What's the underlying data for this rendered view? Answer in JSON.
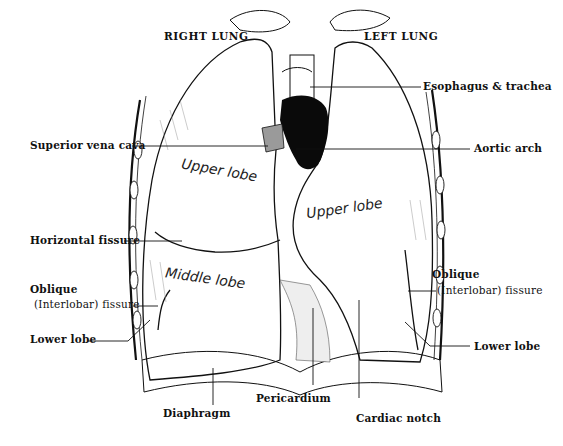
{
  "diagram": {
    "titles": {
      "right_lung": "RIGHT LUNG",
      "left_lung": "LEFT LUNG"
    },
    "lobe_labels": {
      "right_upper": "Upper lobe",
      "right_middle": "Middle lobe",
      "left_upper": "Upper lobe"
    },
    "labels_left": {
      "superior_vena_cava": "Superior vena cava",
      "horizontal_fissure": "Horizontal fissure",
      "oblique_line1": "Oblique",
      "oblique_line2": "(Interlobar) fissure",
      "lower_lobe": "Lower lobe"
    },
    "labels_right": {
      "esophagus_trachea": "Esophagus & trachea",
      "aortic_arch": "Aortic arch",
      "oblique_line1": "Oblique",
      "oblique_line2": "(Interlobar) fissure",
      "lower_lobe": "Lower lobe"
    },
    "labels_bottom": {
      "diaphragm": "Diaphragm",
      "pericardium": "Pericardium",
      "cardiac_notch": "Cardiac notch"
    },
    "colors": {
      "ink": "#111111",
      "background": "#ffffff",
      "aorta_fill": "#0a0a0a",
      "vena_cava_fill": "#9a9a9a"
    }
  }
}
